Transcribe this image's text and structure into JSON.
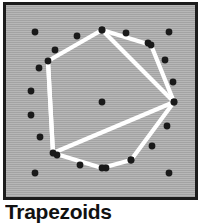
{
  "figure": {
    "caption": "Trapezoids",
    "panel": {
      "background_color": "#a9a9a9",
      "border_color": "#1c1c1c",
      "border_width": 3
    },
    "ink": {
      "dot_color": "#1a1a1a",
      "line_color": "#ffffff",
      "line_width": 4.2,
      "dot_radius": 3.4
    },
    "geometry": {
      "description": "Circle of evenly spaced dots with a white inscribed polygon dissected into trapezoids by white chords, plus a center dot and four corner dots.",
      "center": {
        "x": 96,
        "y": 97
      },
      "ring_radius": 72,
      "ring_dot_count": 18,
      "ring_dots": [
        {
          "id": 0,
          "x": 96,
          "y": 25
        },
        {
          "id": 1,
          "x": 120,
          "y": 28
        },
        {
          "id": 2,
          "x": 142,
          "y": 38
        },
        {
          "id": 3,
          "x": 159,
          "y": 55
        },
        {
          "id": 4,
          "x": 167,
          "y": 77
        },
        {
          "id": 5,
          "x": 168,
          "y": 97
        },
        {
          "id": 6,
          "x": 161,
          "y": 121
        },
        {
          "id": 7,
          "x": 146,
          "y": 141
        },
        {
          "id": 8,
          "x": 125,
          "y": 155
        },
        {
          "id": 9,
          "x": 100,
          "y": 163
        },
        {
          "id": 10,
          "x": 74,
          "y": 160
        },
        {
          "id": 11,
          "x": 51,
          "y": 150
        },
        {
          "id": 12,
          "x": 34,
          "y": 132
        },
        {
          "id": 13,
          "x": 25,
          "y": 110
        },
        {
          "id": 14,
          "x": 25,
          "y": 86
        },
        {
          "id": 15,
          "x": 33,
          "y": 63
        },
        {
          "id": 16,
          "x": 49,
          "y": 45
        },
        {
          "id": 17,
          "x": 71,
          "y": 31
        }
      ],
      "center_dot": {
        "x": 96,
        "y": 97
      },
      "corner_dots": [
        {
          "id": "tl",
          "x": 29,
          "y": 27
        },
        {
          "id": "tr",
          "x": 163,
          "y": 27
        },
        {
          "id": "bl",
          "x": 29,
          "y": 168
        },
        {
          "id": "br",
          "x": 163,
          "y": 168
        }
      ],
      "polygon_vertices": [
        {
          "id": "A",
          "x": 96,
          "y": 25,
          "note": "top"
        },
        {
          "id": "B",
          "x": 145,
          "y": 40,
          "note": "upper right"
        },
        {
          "id": "C",
          "x": 168,
          "y": 97,
          "note": "right"
        },
        {
          "id": "D",
          "x": 125,
          "y": 155,
          "note": "lower right"
        },
        {
          "id": "E",
          "x": 96,
          "y": 163,
          "note": "bottom"
        },
        {
          "id": "F",
          "x": 47,
          "y": 148,
          "note": "lower left"
        },
        {
          "id": "G",
          "x": 42,
          "y": 56,
          "note": "upper left"
        }
      ],
      "polygon_edges": [
        [
          "A",
          "B"
        ],
        [
          "B",
          "C"
        ],
        [
          "C",
          "D"
        ],
        [
          "D",
          "E"
        ],
        [
          "E",
          "F"
        ],
        [
          "F",
          "G"
        ],
        [
          "G",
          "A"
        ]
      ],
      "chords": [
        {
          "from": "A",
          "to": "C",
          "note": "cuts off upper-right trapezoid"
        },
        {
          "from": "C",
          "to": "F",
          "note": "long diagonal chord"
        },
        {
          "from": "G",
          "to": "F",
          "note": "left vertical chord"
        }
      ]
    }
  }
}
